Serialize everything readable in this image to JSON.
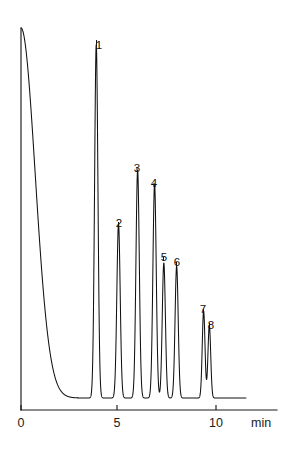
{
  "chart_data": {
    "type": "line",
    "title": "",
    "subtitle": "",
    "xlabel": "min",
    "ylabel": "",
    "xlim": [
      -0.1,
      13.0
    ],
    "ylim": [
      0,
      1.0
    ],
    "grid": false,
    "legend_position": "none",
    "xticks": [
      0,
      5,
      10
    ],
    "xtick_labels": [
      "0",
      "5",
      "10"
    ],
    "yticks": [],
    "ytick_labels": [],
    "series": [
      {
        "name": "detector-signal",
        "description": "Chromatogram trace: solvent front at t=0 followed by eight resolved component peaks on a flat baseline.",
        "baseline_level": 0.0
      }
    ],
    "peaks": [
      {
        "id": "solvent",
        "label": "",
        "retention_time": 0.0,
        "height": 1.0,
        "width": 0.3,
        "tailing": 2.4,
        "labeled": false
      },
      {
        "id": "1",
        "label": "1",
        "retention_time": 3.82,
        "height": 0.955,
        "width": 0.085,
        "tailing": 1.0,
        "labeled": true
      },
      {
        "id": "2",
        "label": "2",
        "retention_time": 4.95,
        "height": 0.47,
        "width": 0.085,
        "tailing": 1.0,
        "labeled": true
      },
      {
        "id": "3",
        "label": "3",
        "retention_time": 5.92,
        "height": 0.615,
        "width": 0.085,
        "tailing": 1.0,
        "labeled": true
      },
      {
        "id": "4",
        "label": "4",
        "retention_time": 6.78,
        "height": 0.578,
        "width": 0.085,
        "tailing": 1.0,
        "labeled": true
      },
      {
        "id": "5",
        "label": "5",
        "retention_time": 7.25,
        "height": 0.365,
        "width": 0.08,
        "tailing": 1.0,
        "labeled": true
      },
      {
        "id": "6",
        "label": "6",
        "retention_time": 7.9,
        "height": 0.356,
        "width": 0.08,
        "tailing": 1.0,
        "labeled": true
      },
      {
        "id": "7",
        "label": "7",
        "retention_time": 9.27,
        "height": 0.235,
        "width": 0.07,
        "tailing": 1.0,
        "labeled": true
      },
      {
        "id": "8",
        "label": "8",
        "retention_time": 9.56,
        "height": 0.196,
        "width": 0.07,
        "tailing": 1.0,
        "labeled": true
      }
    ],
    "annotations": [
      {
        "name": "peak-label-1",
        "text": "1",
        "x_px": 99,
        "y_px": 40,
        "leader_from_px": [
          96.5,
          46
        ],
        "leader_to_px": [
          96.5,
          40
        ]
      },
      {
        "name": "peak-label-2",
        "text": "2",
        "x_px": 119,
        "y_px": 218,
        "leader_from_px": [
          118.5,
          226
        ],
        "leader_to_px": [
          118.5,
          222
        ]
      },
      {
        "name": "peak-label-3",
        "text": "3",
        "x_px": 137,
        "y_px": 163,
        "leader_from_px": [
          137.0,
          172
        ],
        "leader_to_px": [
          137.0,
          168
        ]
      },
      {
        "name": "peak-label-4",
        "text": "4",
        "x_px": 154,
        "y_px": 178,
        "leader_from_px": [
          154.0,
          187
        ],
        "leader_to_px": [
          154.0,
          183
        ]
      },
      {
        "name": "peak-label-5",
        "text": "5",
        "x_px": 164,
        "y_px": 252,
        "leader_from_px": [
          163.5,
          261
        ],
        "leader_to_px": [
          163.5,
          257
        ]
      },
      {
        "name": "peak-label-6",
        "text": "6",
        "x_px": 177,
        "y_px": 257,
        "leader_from_px": [
          176.5,
          266
        ],
        "leader_to_px": [
          176.5,
          262
        ]
      },
      {
        "name": "peak-label-7",
        "text": "7",
        "x_px": 203,
        "y_px": 304,
        "leader_from_px": [
          203.5,
          312
        ],
        "leader_to_px": [
          203.5,
          309
        ]
      },
      {
        "name": "peak-label-8",
        "text": "8",
        "x_px": 211,
        "y_px": 320,
        "leader_from_px": [
          209.5,
          326
        ],
        "leader_to_px": [
          209.5,
          323
        ]
      }
    ],
    "axis_geometry": {
      "origin_px": [
        21,
        410
      ],
      "x_axis_end_px": [
        277,
        410
      ],
      "y_axis_top_px": [
        21,
        28
      ],
      "baseline_px_y": 398,
      "px_per_minute": 19.7,
      "trace_end_px_x": 246
    },
    "tick_marks": [
      {
        "value": "0",
        "x_px": 21,
        "label_x_px": 21,
        "label_y_px": 417
      },
      {
        "value": "5",
        "x_px": 117,
        "label_x_px": 117,
        "label_y_px": 417
      },
      {
        "value": "10",
        "x_px": 216,
        "label_x_px": 216,
        "label_y_px": 417
      }
    ],
    "unit_label": {
      "text": "min",
      "x_px": 251,
      "y_px": 417
    },
    "colors": {
      "trace": "#111111",
      "axis": "#1a1a1a",
      "label": "#111111",
      "background": "#ffffff"
    }
  }
}
